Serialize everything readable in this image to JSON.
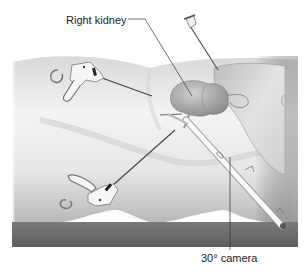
{
  "figure": {
    "type": "medical-illustration",
    "labels": {
      "kidney": "Right kidney",
      "camera": "30° camera"
    },
    "elements": [
      "patient-body",
      "operating-table",
      "right-kidney",
      "liver",
      "grasper-upper",
      "grasper-lower",
      "30-degree-camera-scope",
      "retractor-needle"
    ],
    "colors": {
      "background": "#ffffff",
      "body_light": "#f2f2f2",
      "body_shadow": "#bdbdbd",
      "table": "#6e6e6e",
      "kidney": "#a9a9a9",
      "instrument": "#f7f7f7",
      "line": "#333333"
    }
  }
}
